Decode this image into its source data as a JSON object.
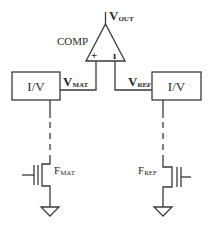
{
  "diagram": {
    "comparator": {
      "label": "COMP",
      "plus_sign": "+",
      "minus_sign": "ı",
      "output": {
        "main": "V",
        "sub": "OUT"
      }
    },
    "left_branch": {
      "converter_label": "I/V",
      "node": {
        "main": "V",
        "sub": "MAT"
      },
      "transistor": {
        "main": "F",
        "sub": "MAT"
      }
    },
    "right_branch": {
      "converter_label": "I/V",
      "node": {
        "main": "V",
        "sub": "REF"
      },
      "transistor": {
        "main": "F",
        "sub": "REF"
      }
    },
    "colors": {
      "line": "#3a3a3a",
      "text": "#2a2a2a",
      "background": "#ffffff"
    }
  }
}
